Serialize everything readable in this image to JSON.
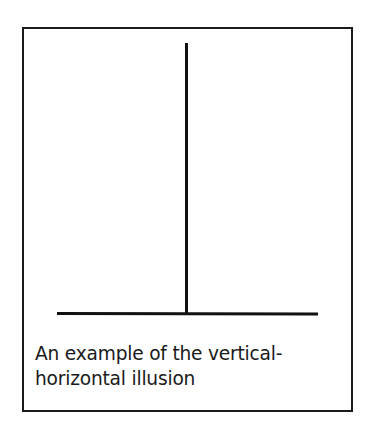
{
  "figure": {
    "caption_line1": "An example of the vertical-",
    "caption_line2": "horizontal illusion",
    "caption": "An example of the vertical-horizontal illusion",
    "elements": {
      "vertical_line": {
        "x": 186,
        "y_top": 43,
        "y_bottom": 313
      },
      "horizontal_line": {
        "x_left": 57,
        "x_right": 318,
        "y": 313
      }
    },
    "colors": {
      "line": "#111111",
      "frame": "#1a1a1a",
      "background": "#ffffff"
    }
  }
}
